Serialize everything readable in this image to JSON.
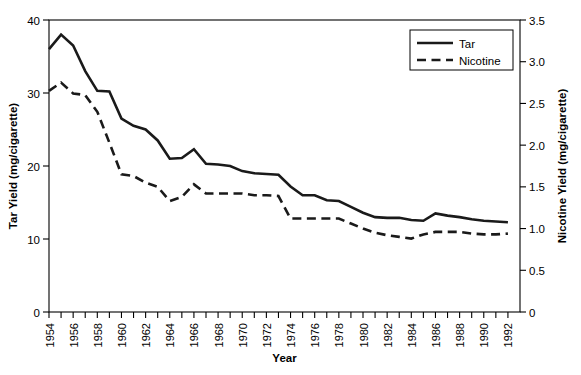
{
  "chart_data": {
    "type": "line",
    "title": "",
    "xlabel": "Year",
    "ylabel": "Tar Yield (mg/cigarette)",
    "y2label": "Nicotine Yield (mg/cigarette)",
    "xlim": [
      1954,
      1993
    ],
    "ylim": [
      0,
      40
    ],
    "y2lim": [
      0,
      3.5
    ],
    "yticks": [
      0,
      10,
      20,
      30,
      40
    ],
    "yticklabels": [
      "0",
      "10",
      "20",
      "30",
      "40"
    ],
    "y2ticks": [
      0,
      0.5,
      1.0,
      1.5,
      2.0,
      2.5,
      3.0,
      3.5
    ],
    "y2ticklabels": [
      "0",
      "0.5",
      "1.0",
      "1.5",
      "2.0",
      "2.5",
      "3.0",
      "3.5"
    ],
    "xticklabels": [
      "1954",
      "1956",
      "1958",
      "1960",
      "1962",
      "1964",
      "1966",
      "1968",
      "1970",
      "1972",
      "1974",
      "1976",
      "1978",
      "1980",
      "1982",
      "1984",
      "1986",
      "1988",
      "1990",
      "1992"
    ],
    "xtick_step": 1,
    "xlabel_step": 2,
    "grid": false,
    "legend_position": "top-right",
    "x": [
      1954,
      1955,
      1956,
      1957,
      1958,
      1959,
      1960,
      1961,
      1962,
      1963,
      1964,
      1965,
      1966,
      1967,
      1968,
      1969,
      1970,
      1971,
      1972,
      1973,
      1974,
      1975,
      1976,
      1977,
      1978,
      1979,
      1980,
      1981,
      1982,
      1983,
      1984,
      1985,
      1986,
      1987,
      1988,
      1989,
      1990,
      1991,
      1992
    ],
    "series": [
      {
        "name": "Tar",
        "axis": "left",
        "style": "solid",
        "units": "mg/cigarette",
        "values": [
          36.0,
          38.0,
          36.5,
          33.0,
          30.3,
          30.2,
          26.5,
          25.5,
          25.0,
          23.5,
          21.0,
          21.1,
          22.3,
          20.3,
          20.2,
          20.0,
          19.3,
          19.0,
          18.9,
          18.8,
          17.2,
          16.0,
          16.0,
          15.3,
          15.2,
          14.4,
          13.6,
          13.0,
          12.9,
          12.9,
          12.6,
          12.5,
          13.5,
          13.2,
          13.0,
          12.7,
          12.5,
          12.4,
          12.3
        ]
      },
      {
        "name": "Nicotine",
        "axis": "right",
        "style": "dashed",
        "units": "mg/cigarette",
        "values": [
          2.65,
          2.75,
          2.62,
          2.6,
          2.4,
          2.03,
          1.65,
          1.63,
          1.55,
          1.5,
          1.33,
          1.38,
          1.53,
          1.42,
          1.42,
          1.42,
          1.42,
          1.4,
          1.4,
          1.39,
          1.12,
          1.12,
          1.12,
          1.12,
          1.12,
          1.06,
          1.0,
          0.95,
          0.92,
          0.9,
          0.88,
          0.93,
          0.96,
          0.96,
          0.96,
          0.94,
          0.93,
          0.93,
          0.94
        ]
      }
    ]
  },
  "legend": {
    "items": [
      {
        "label": "Tar",
        "style": "solid"
      },
      {
        "label": "Nicotine",
        "style": "dashed"
      }
    ]
  }
}
